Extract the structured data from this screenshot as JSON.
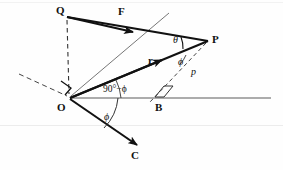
{
  "figure": {
    "kind": "physics-vector-diagram",
    "canvas": {
      "width": 283,
      "height": 170
    },
    "background_color": "#fefefe",
    "ink_color": "#111111",
    "thin_color": "#555555"
  },
  "labels": {
    "point_q": "Q",
    "point_p": "P",
    "point_o": "O",
    "point_b": "B",
    "point_c": "C",
    "vector_f": "F",
    "vector_r": "r",
    "angle_theta": "θ",
    "angle_phi_p": "ϕ",
    "angle_phi_o": "ϕ",
    "angle_complement": "90°−ϕ",
    "moment_arm": "p"
  },
  "label_positions": {
    "point_q": {
      "x": 56,
      "y": 5
    },
    "vector_f": {
      "x": 118,
      "y": 6
    },
    "point_p": {
      "x": 212,
      "y": 34
    },
    "angle_theta": {
      "x": 173,
      "y": 35
    },
    "vector_r": {
      "x": 148,
      "y": 55
    },
    "angle_phi_p": {
      "x": 178,
      "y": 57
    },
    "moment_arm": {
      "x": 191,
      "y": 67
    },
    "angle_complement": {
      "x": 103,
      "y": 85
    },
    "point_o": {
      "x": 57,
      "y": 102
    },
    "point_b": {
      "x": 155,
      "y": 102
    },
    "angle_phi_o": {
      "x": 104,
      "y": 112
    },
    "point_c": {
      "x": 131,
      "y": 150
    }
  },
  "geometry": {
    "points": {
      "O": {
        "x": 70,
        "y": 98
      },
      "P": {
        "x": 208,
        "y": 41
      },
      "Q": {
        "x": 66,
        "y": 17
      },
      "B": {
        "x": 161,
        "y": 98
      },
      "C": {
        "x": 139,
        "y": 147
      },
      "horizontal_right_end": {
        "x": 271,
        "y": 98
      },
      "incline_dashed_end": {
        "x": 19,
        "y": 74
      },
      "op_extension_end": {
        "x": 169,
        "y": 13
      },
      "f_arrow_tip": {
        "x": 130,
        "y": 31
      },
      "r_arrow_tip": {
        "x": 159,
        "y": 61
      },
      "c_arrow_tip": {
        "x": 137,
        "y": 145
      }
    },
    "segments": [
      {
        "name": "line-QP-force",
        "from": "Q",
        "to": "P",
        "style": "solid-bold"
      },
      {
        "name": "line-OP-r",
        "from": "O",
        "to": "P",
        "style": "solid-bold"
      },
      {
        "name": "line-OQ",
        "from": "O",
        "to": "Q",
        "style": "solid-thin"
      },
      {
        "name": "line-OC",
        "from": "O",
        "to": "C",
        "style": "solid-bold"
      },
      {
        "name": "line-O-extension",
        "from": "O",
        "to": "op_extension_end",
        "style": "solid-thin"
      },
      {
        "name": "line-horizontal-OB",
        "from": "O",
        "to": "horizontal_right_end",
        "style": "solid-thin"
      },
      {
        "name": "line-incline-dashed",
        "from": "incline_dashed_end",
        "to": "O",
        "style": "dashed"
      },
      {
        "name": "line-QO-dashed",
        "from": "Q",
        "to": "O",
        "style": "dashed-vertical"
      },
      {
        "name": "line-PB-dashed",
        "from": "P",
        "to": "B",
        "style": "dashed"
      }
    ],
    "arrows": [
      {
        "name": "arrow-f",
        "on": "line-QP-force",
        "tip": "f_arrow_tip",
        "direction": "toward-P"
      },
      {
        "name": "arrow-r",
        "on": "line-OP-r",
        "tip": "r_arrow_tip",
        "direction": "toward-P"
      },
      {
        "name": "arrow-c",
        "on": "line-OC",
        "tip": "c_arrow_tip",
        "direction": "toward-C"
      }
    ],
    "right_angle_markers": [
      {
        "name": "right-angle-at-O",
        "x": 62,
        "y": 80
      },
      {
        "name": "right-angle-at-B",
        "x": 152,
        "y": 87
      }
    ],
    "angle_arcs": [
      {
        "name": "arc-theta-at-P",
        "vertex": "P",
        "label": "θ"
      },
      {
        "name": "arc-phi-at-P",
        "vertex": "P",
        "label": "ϕ"
      },
      {
        "name": "arc-complement-at-O",
        "vertex": "O",
        "label": "90°−ϕ"
      },
      {
        "name": "arc-phi-at-O",
        "vertex": "O",
        "label": "ϕ"
      }
    ],
    "scan_artifact_line": {
      "y": 125,
      "color": "#e8e8e8"
    }
  }
}
